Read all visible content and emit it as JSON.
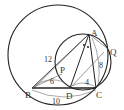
{
  "diagram": {
    "type": "geometry",
    "points": {
      "A": {
        "label": "A",
        "x": 89,
        "y": 34
      },
      "B": {
        "label": "B",
        "x": 32,
        "y": 88
      },
      "C": {
        "label": "C",
        "x": 96,
        "y": 88
      },
      "D": {
        "label": "D",
        "x": 70,
        "y": 88
      },
      "P": {
        "label": "P",
        "x": 62,
        "y": 70
      },
      "Q": {
        "label": "Q",
        "x": 108,
        "y": 49
      }
    },
    "lengths": {
      "AB": "12",
      "BP": "6",
      "DC": "4",
      "AC": "8",
      "BC": "10"
    },
    "circles": [
      {
        "name": "circumcircle-ABC",
        "cx": 58,
        "cy": 55,
        "r": 50
      },
      {
        "name": "circle-ADC",
        "cx": 83,
        "cy": 62,
        "r": 28
      }
    ]
  }
}
